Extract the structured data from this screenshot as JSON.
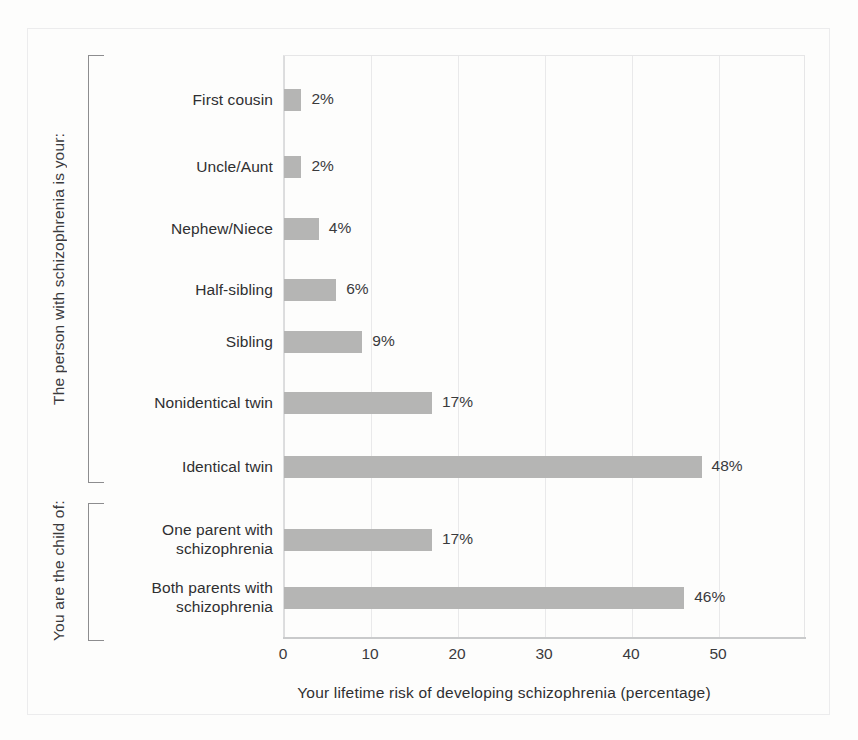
{
  "chart_data": {
    "type": "bar",
    "orientation": "horizontal",
    "title": "",
    "xlabel": "Your lifetime risk of developing schizophrenia (percentage)",
    "ylabel": "",
    "xlim": [
      0,
      60
    ],
    "xticks": [
      0,
      10,
      20,
      30,
      40,
      50
    ],
    "xtick_labels": [
      "0",
      "10",
      "20",
      "30",
      "40",
      "50"
    ],
    "grid": "vertical",
    "legend": "none",
    "bar_color": "#b5b5b4",
    "categories": [
      "First cousin",
      "Uncle/Aunt",
      "Nephew/Niece",
      "Half-sibling",
      "Sibling",
      "Nonidentical twin",
      "Identical twin",
      "One parent with\nschizophrenia",
      "Both parents with\nschizophrenia"
    ],
    "values": [
      2,
      2,
      4,
      6,
      9,
      17,
      48,
      17,
      46
    ],
    "value_labels": [
      "2%",
      "2%",
      "4%",
      "6%",
      "9%",
      "17%",
      "48%",
      "17%",
      "46%"
    ],
    "groups": [
      {
        "label": "The person with schizophrenia is your:",
        "categories": [
          "First cousin",
          "Uncle/Aunt",
          "Nephew/Niece",
          "Half-sibling",
          "Sibling",
          "Nonidentical twin",
          "Identical twin"
        ]
      },
      {
        "label": "You are the child of:",
        "categories": [
          "One parent with schizophrenia",
          "Both parents with schizophrenia"
        ]
      }
    ]
  }
}
